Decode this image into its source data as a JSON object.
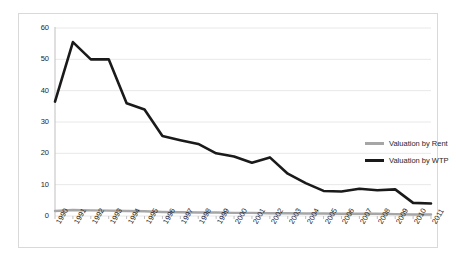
{
  "chart_data": {
    "type": "line",
    "title": "",
    "subtitle": "",
    "xlabel": "",
    "ylabel": "",
    "categories": [
      "1990",
      "1991",
      "1992",
      "1993",
      "1994",
      "1995",
      "1996",
      "1997",
      "1998",
      "1999",
      "2000",
      "2001",
      "2002",
      "2003",
      "2004",
      "2005",
      "2006",
      "2007",
      "2008",
      "2009",
      "2010",
      "2011"
    ],
    "series": [
      {
        "name": "Valuation by Rent",
        "color": "#a6a6a6",
        "values": [
          1.6,
          1.9,
          1.8,
          1.7,
          1.6,
          1.5,
          1.3,
          1.2,
          1.1,
          1.1,
          1.0,
          1.0,
          0.9,
          0.9,
          0.8,
          0.8,
          0.7,
          0.7,
          0.7,
          0.6,
          0.5,
          0.5
        ]
      },
      {
        "name": "Valuation by WTP",
        "color": "#1a1a1a",
        "values": [
          36.5,
          55.5,
          50.0,
          50.0,
          36.0,
          34.0,
          25.5,
          24.2,
          23.0,
          20.0,
          19.0,
          17.0,
          18.7,
          13.5,
          10.5,
          8.0,
          7.8,
          8.7,
          8.2,
          8.5,
          4.2,
          4.0
        ]
      }
    ],
    "ylim": [
      0,
      60
    ],
    "yticks": [
      0,
      10,
      20,
      30,
      40,
      50,
      60
    ],
    "ytick_labels": [
      "0",
      "10",
      "20",
      "30",
      "40",
      "50",
      "60"
    ],
    "grid": "horizontal",
    "legend_position": "right",
    "plot_background": "#ffffff",
    "gridline_color": "#e8e8e8",
    "frame_color": "#d9d9d9"
  },
  "legend": {
    "items": [
      {
        "label": "Valuation by Rent"
      },
      {
        "label": "Valuation by WTP"
      }
    ]
  }
}
